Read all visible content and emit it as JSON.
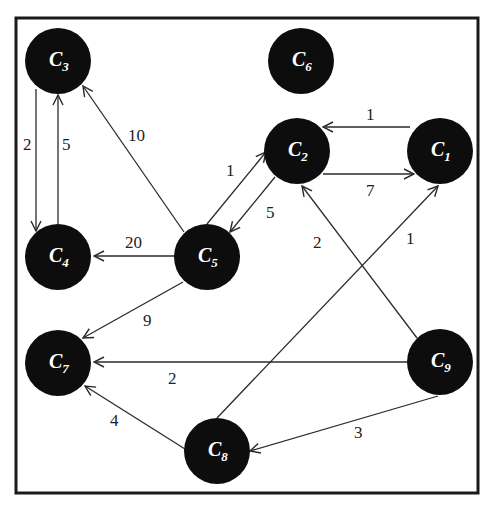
{
  "diagram": {
    "type": "directed-weighted-graph",
    "frame": {
      "x": 16,
      "y": 18,
      "width": 462,
      "height": 475
    },
    "node_radius": 33,
    "colors": {
      "node_fill": "#0d0d0d",
      "node_text": "#ffffff",
      "edge": "#2a2a2a",
      "frame": "#1a1a1a",
      "weight_text": "#222222"
    },
    "nodes": [
      {
        "id": "C1",
        "letter": "C",
        "sub": "1",
        "x": 440,
        "y": 151
      },
      {
        "id": "C2",
        "letter": "C",
        "sub": "2",
        "x": 297,
        "y": 151
      },
      {
        "id": "C3",
        "letter": "C",
        "sub": "3",
        "x": 58,
        "y": 61
      },
      {
        "id": "C4",
        "letter": "C",
        "sub": "4",
        "x": 58,
        "y": 257
      },
      {
        "id": "C5",
        "letter": "C",
        "sub": "5",
        "x": 207,
        "y": 257
      },
      {
        "id": "C6",
        "letter": "C",
        "sub": "6",
        "x": 301,
        "y": 61
      },
      {
        "id": "C7",
        "letter": "C",
        "sub": "7",
        "x": 58,
        "y": 363
      },
      {
        "id": "C8",
        "letter": "C",
        "sub": "8",
        "x": 217,
        "y": 451
      },
      {
        "id": "C9",
        "letter": "C",
        "sub": "9",
        "x": 440,
        "y": 362
      }
    ],
    "edges": [
      {
        "from": "C1",
        "to": "C2",
        "weight": "1",
        "x1": 410,
        "y1": 127,
        "x2": 323,
        "y2": 127,
        "lx": 366,
        "ly": 120
      },
      {
        "from": "C2",
        "to": "C1",
        "weight": "7",
        "x1": 323,
        "y1": 174,
        "x2": 414,
        "y2": 174,
        "lx": 366,
        "ly": 196
      },
      {
        "from": "C3",
        "to": "C4",
        "weight": "2",
        "x1": 36,
        "y1": 89,
        "x2": 36,
        "y2": 231,
        "lx": 23,
        "ly": 150
      },
      {
        "from": "C4",
        "to": "C3",
        "weight": "5",
        "x1": 58,
        "y1": 224,
        "x2": 58,
        "y2": 95,
        "lx": 62,
        "ly": 150
      },
      {
        "from": "C5",
        "to": "C3",
        "weight": "10",
        "x1": 184,
        "y1": 232,
        "x2": 83,
        "y2": 86,
        "lx": 128,
        "ly": 141
      },
      {
        "from": "C5",
        "to": "C2",
        "weight": "1",
        "x1": 207,
        "y1": 224,
        "x2": 266,
        "y2": 152,
        "lx": 226,
        "ly": 176
      },
      {
        "from": "C2",
        "to": "C5",
        "weight": "5",
        "x1": 275,
        "y1": 177,
        "x2": 230,
        "y2": 232,
        "lx": 266,
        "ly": 218
      },
      {
        "from": "C5",
        "to": "C4",
        "weight": "20",
        "x1": 174,
        "y1": 256,
        "x2": 94,
        "y2": 256,
        "lx": 125,
        "ly": 248
      },
      {
        "from": "C5",
        "to": "C7",
        "weight": "9",
        "x1": 183,
        "y1": 282,
        "x2": 83,
        "y2": 338,
        "lx": 143,
        "ly": 326
      },
      {
        "from": "C9",
        "to": "C2",
        "weight": "2",
        "x1": 417,
        "y1": 338,
        "x2": 302,
        "y2": 186,
        "lx": 313,
        "ly": 248
      },
      {
        "from": "C8",
        "to": "C1",
        "weight": "1",
        "x1": 217,
        "y1": 418,
        "x2": 438,
        "y2": 186,
        "lx": 406,
        "ly": 244
      },
      {
        "from": "C9",
        "to": "C7",
        "weight": "2",
        "x1": 407,
        "y1": 362,
        "x2": 94,
        "y2": 362,
        "lx": 168,
        "ly": 384
      },
      {
        "from": "C8",
        "to": "C7",
        "weight": "4",
        "x1": 185,
        "y1": 449,
        "x2": 85,
        "y2": 386,
        "lx": 110,
        "ly": 426
      },
      {
        "from": "C9",
        "to": "C8",
        "weight": "3",
        "x1": 438,
        "y1": 396,
        "x2": 250,
        "y2": 451,
        "lx": 354,
        "ly": 438
      }
    ]
  }
}
